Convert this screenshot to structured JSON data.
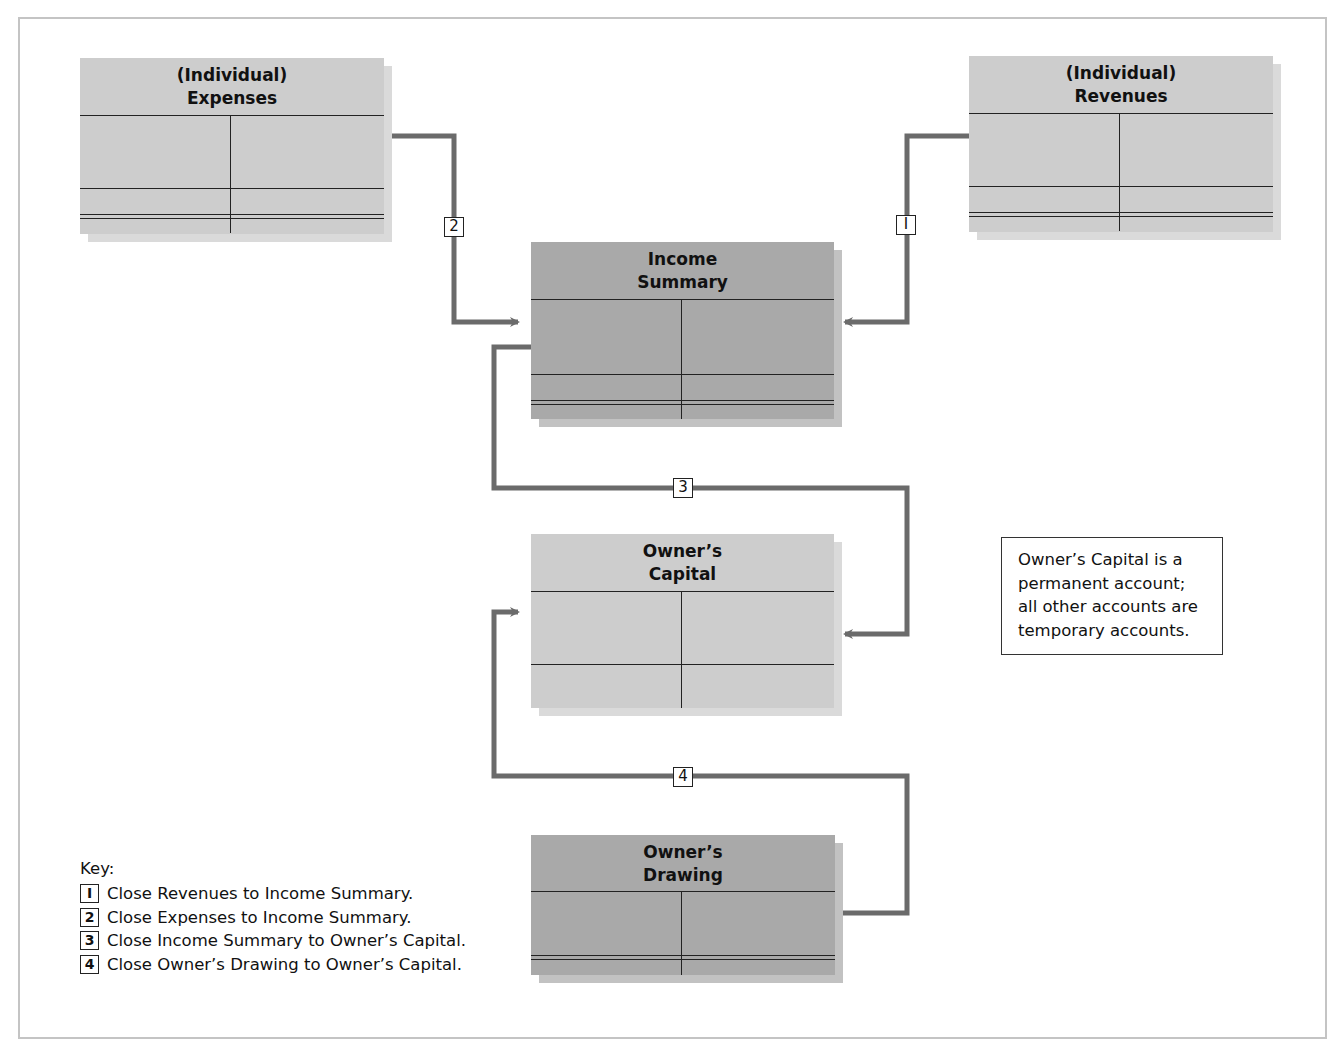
{
  "colors": {
    "connector": "#6b6b6b",
    "account_light": "#cdcdcd",
    "account_dark": "#a9a9a9",
    "line": "#222222",
    "frame_border": "#c4c4c4"
  },
  "accounts": {
    "expenses": {
      "line1": "(Individual)",
      "line2": "Expenses",
      "shade": "light"
    },
    "revenues": {
      "line1": "(Individual)",
      "line2": "Revenues",
      "shade": "light"
    },
    "income_summary": {
      "line1": "Income",
      "line2": "Summary",
      "shade": "dark"
    },
    "owners_capital": {
      "line1": "Owner’s",
      "line2": "Capital",
      "shade": "light"
    },
    "owners_drawing": {
      "line1": "Owner’s",
      "line2": "Drawing",
      "shade": "dark"
    }
  },
  "steps": [
    {
      "number": "1",
      "glyph": "I",
      "from": "Revenues",
      "to": "Income Summary"
    },
    {
      "number": "2",
      "glyph": "2",
      "from": "Expenses",
      "to": "Income Summary"
    },
    {
      "number": "3",
      "glyph": "3",
      "from": "Income Summary",
      "to": "Owner’s Capital"
    },
    {
      "number": "4",
      "glyph": "4",
      "from": "Owner’s Drawing",
      "to": "Owner’s Capital"
    }
  ],
  "note": {
    "line1": "Owner’s Capital is a",
    "line2": "permanent account;",
    "line3": "all other accounts are",
    "line4": "temporary accounts."
  },
  "key": {
    "title": "Key:",
    "items": [
      {
        "badge": "I",
        "text": "Close Revenues to Income Summary."
      },
      {
        "badge": "2",
        "text": "Close Expenses to Income Summary."
      },
      {
        "badge": "3",
        "text": "Close Income Summary to Owner’s Capital."
      },
      {
        "badge": "4",
        "text": "Close Owner’s Drawing to Owner’s Capital."
      }
    ]
  }
}
